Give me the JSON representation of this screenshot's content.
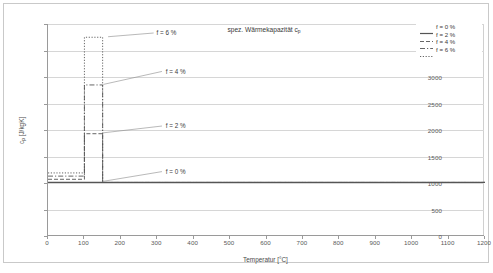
{
  "chart_data": {
    "type": "line",
    "title_plain": "spez. Wärmekapazität cp",
    "xlabel": "Temperatur [°C]",
    "ylabel": "cₚ [J/kgK]",
    "ylabel_plain": "cp [J/kgK]",
    "xlim": [
      0,
      1200
    ],
    "ylim": [
      0,
      4000
    ],
    "xticks": [
      0,
      100,
      200,
      300,
      400,
      500,
      600,
      700,
      800,
      900,
      1000,
      1100,
      1200
    ],
    "yticks": [
      0,
      500,
      1000,
      1500,
      2000,
      2500,
      3000,
      3500,
      4000
    ],
    "grid": "horizontal",
    "legend_position": "top-right",
    "series": [
      {
        "name": "f = 0 %",
        "style": "solid",
        "color": "#555555",
        "baseline": 1010,
        "peak": 1010,
        "peak_start": 100,
        "peak_end": 150,
        "x": [
          0,
          100,
          100,
          150,
          150,
          1200
        ],
        "values": [
          1010,
          1010,
          1010,
          1010,
          1010,
          1010
        ]
      },
      {
        "name": "f = 2 %",
        "style": "dashed",
        "color": "#555555",
        "baseline": 1070,
        "peak": 1930,
        "peak_start": 100,
        "peak_end": 150,
        "x": [
          0,
          100,
          100,
          150,
          150,
          1200
        ],
        "values": [
          1070,
          1070,
          1930,
          1930,
          1010,
          1010
        ]
      },
      {
        "name": "f = 4 %",
        "style": "dash-dot",
        "color": "#555555",
        "baseline": 1130,
        "peak": 2850,
        "peak_start": 100,
        "peak_end": 150,
        "x": [
          0,
          100,
          100,
          150,
          150,
          1200
        ],
        "values": [
          1130,
          1130,
          2850,
          2850,
          1010,
          1010
        ]
      },
      {
        "name": "f = 6 %",
        "style": "dotted",
        "color": "#555555",
        "baseline": 1190,
        "peak": 3750,
        "peak_start": 100,
        "peak_end": 150,
        "x": [
          0,
          100,
          100,
          150,
          150,
          1200
        ],
        "values": [
          1190,
          1190,
          3750,
          3750,
          1010,
          1010
        ]
      }
    ],
    "annotations": [
      {
        "text": "f = 6 %",
        "x": 290,
        "y": 3830
      },
      {
        "text": "f = 4 %",
        "x": 315,
        "y": 3100
      },
      {
        "text": "f = 2 %",
        "x": 315,
        "y": 2070
      },
      {
        "text": "f = 0 %",
        "x": 315,
        "y": 1210
      }
    ]
  },
  "legend": {
    "items": [
      {
        "label": "f = 0 %",
        "style": "solid"
      },
      {
        "label": "f = 2 %",
        "style": "dashed"
      },
      {
        "label": "f = 4 %",
        "style": "dash-dot"
      },
      {
        "label": "f = 6 %",
        "style": "dotted"
      }
    ]
  }
}
